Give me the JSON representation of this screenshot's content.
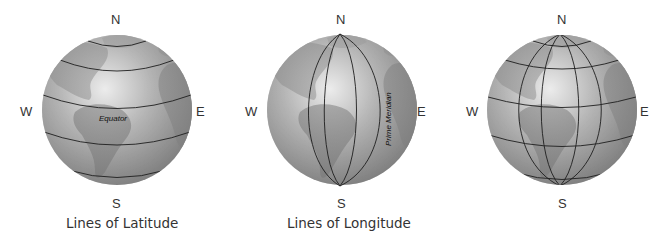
{
  "figure": {
    "panels": [
      {
        "id": "latitude",
        "directions": {
          "north": "N",
          "south": "S",
          "west": "W",
          "east": "E"
        },
        "line_label": "Equator",
        "caption": "Lines of Latitude"
      },
      {
        "id": "longitude",
        "directions": {
          "north": "N",
          "south": "S",
          "west": "W",
          "east": "E"
        },
        "line_label": "Prime Meridian",
        "caption": "Lines of Longitude"
      },
      {
        "id": "grid",
        "directions": {
          "north": "N",
          "south": "S",
          "west": "W",
          "east": "E"
        },
        "caption": ""
      }
    ],
    "colors": {
      "globe_light": "#e2e2e2",
      "globe_mid": "#a8a8a8",
      "globe_dark": "#6e6e6e",
      "land": "#7d7d7d",
      "grid_line": "#1e1e1e",
      "text": "#333333"
    }
  }
}
